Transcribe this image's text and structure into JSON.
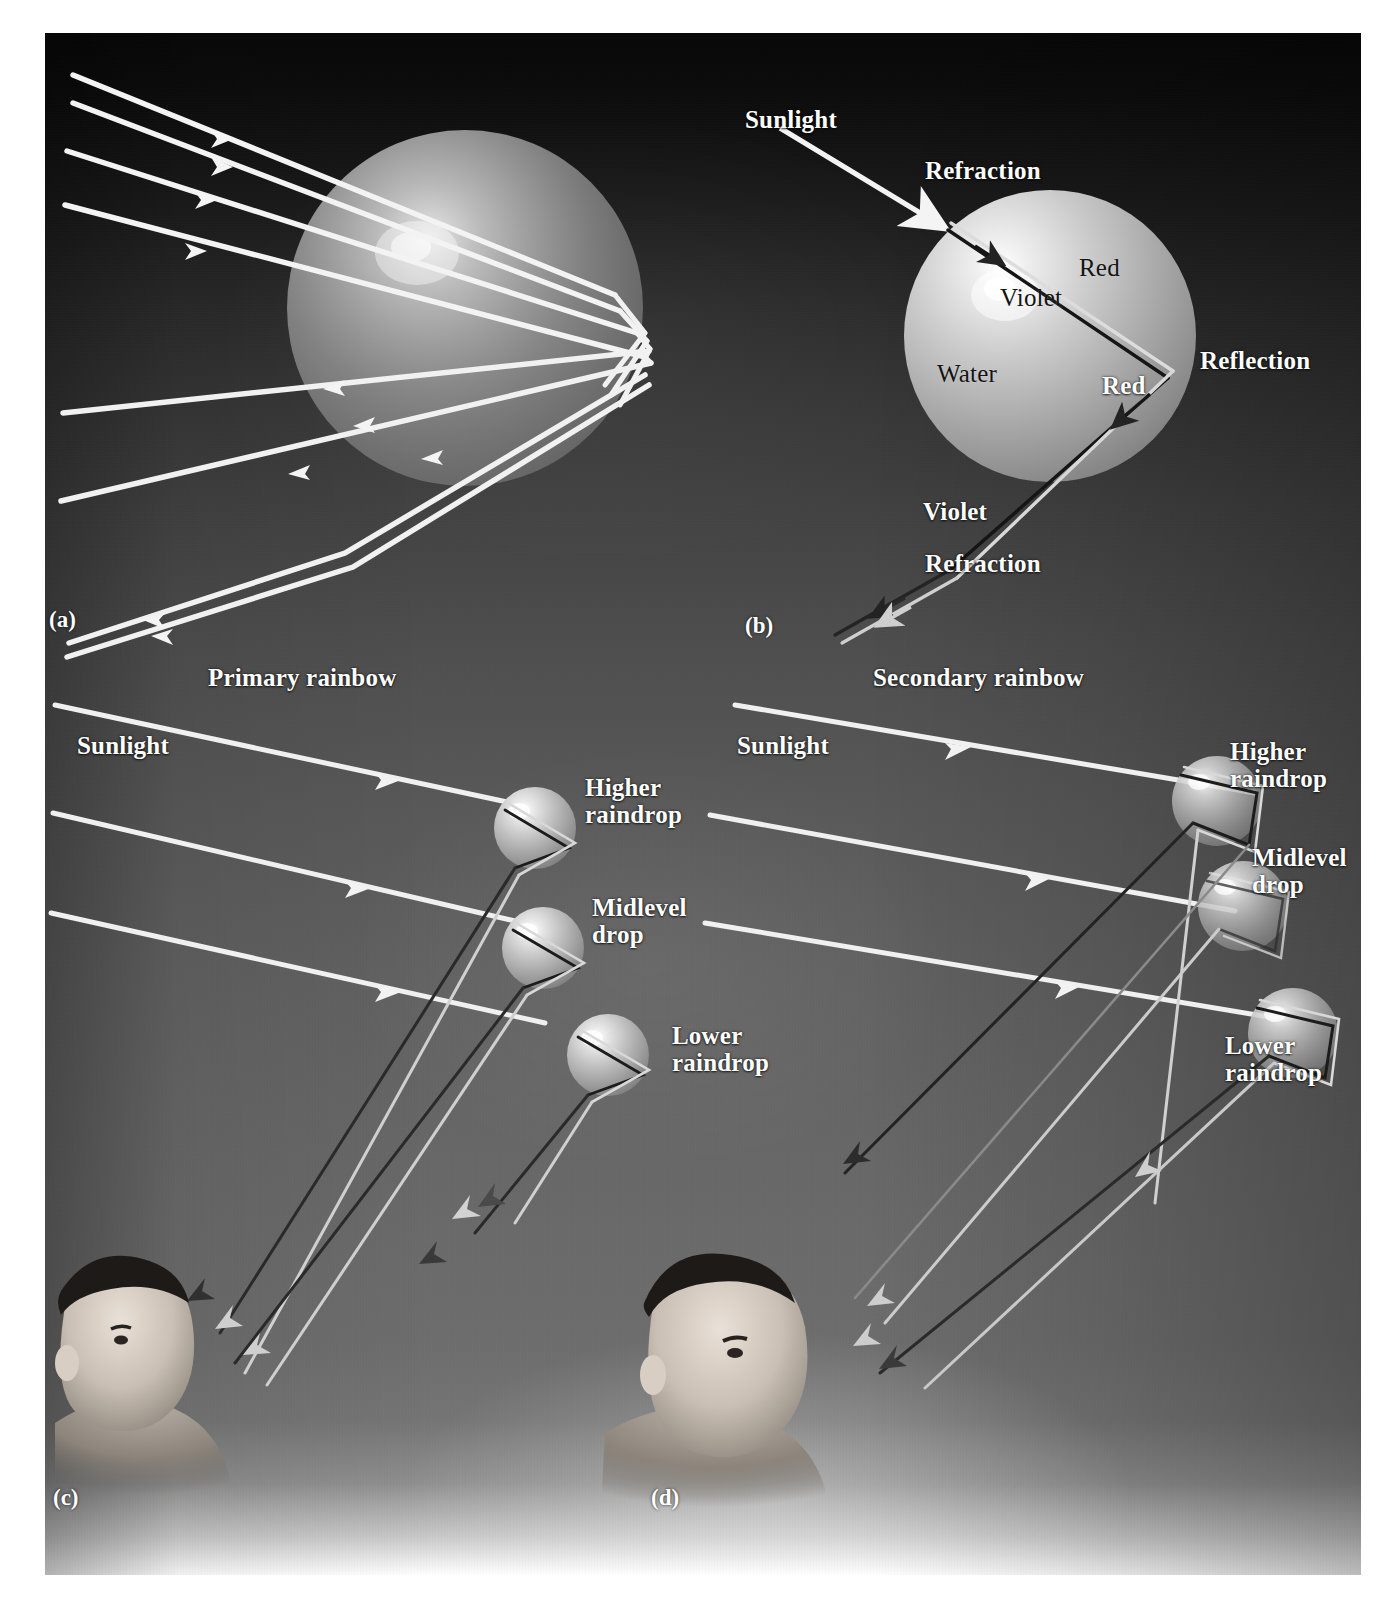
{
  "figure": {
    "kind": "four-panel optics diagram",
    "background": {
      "top_color": "#070707",
      "mid_color": "#5a5a5a",
      "bottom_color": "#ffffff",
      "page_color": "#ffffff"
    },
    "ray_colors": {
      "white_light": "#f2f2f2",
      "red_ray": "#d8d8d8",
      "violet_ray": "#2a2a2a",
      "drop_fill": "#b9b9b9",
      "drop_highlight": "#f5f5f5"
    }
  },
  "panels": [
    {
      "id": "a",
      "id_label": "(a)",
      "caption_labels": []
    },
    {
      "id": "b",
      "id_label": "(b)",
      "caption_labels": [
        {
          "name": "sunlight",
          "text": "Sunlight",
          "style": "white"
        },
        {
          "name": "refraction-1",
          "text": "Refraction",
          "style": "white"
        },
        {
          "name": "red-1",
          "text": "Red",
          "style": "dark"
        },
        {
          "name": "violet-1",
          "text": "Violet",
          "style": "dark"
        },
        {
          "name": "water",
          "text": "Water",
          "style": "dark"
        },
        {
          "name": "reflection",
          "text": "Reflection",
          "style": "white"
        },
        {
          "name": "red-2",
          "text": "Red",
          "style": "white"
        },
        {
          "name": "violet-2",
          "text": "Violet",
          "style": "white"
        },
        {
          "name": "refraction-2",
          "text": "Refraction",
          "style": "white"
        }
      ]
    },
    {
      "id": "c",
      "id_label": "(c)",
      "caption_labels": [
        {
          "name": "primary-rainbow",
          "text": "Primary rainbow",
          "style": "white"
        },
        {
          "name": "sunlight",
          "text": "Sunlight",
          "style": "white"
        },
        {
          "name": "higher-raindrop",
          "text": "Higher\nraindrop",
          "style": "white"
        },
        {
          "name": "midlevel-drop",
          "text": "Midlevel\ndrop",
          "style": "white"
        },
        {
          "name": "lower-raindrop",
          "text": "Lower\nraindrop",
          "style": "white"
        }
      ]
    },
    {
      "id": "d",
      "id_label": "(d)",
      "caption_labels": [
        {
          "name": "secondary-rainbow",
          "text": "Secondary rainbow",
          "style": "white"
        },
        {
          "name": "sunlight",
          "text": "Sunlight",
          "style": "white"
        },
        {
          "name": "higher-raindrop",
          "text": "Higher\nraindrop",
          "style": "white"
        },
        {
          "name": "midlevel-drop",
          "text": "Midlevel\ndrop",
          "style": "white"
        },
        {
          "name": "lower-raindrop",
          "text": "Lower\nraindrop",
          "style": "white"
        }
      ]
    }
  ],
  "labels": {
    "panel_a_id": "(a)",
    "panel_b_id": "(b)",
    "panel_c_id": "(c)",
    "panel_d_id": "(d)",
    "b_sunlight": "Sunlight",
    "b_refraction_top": "Refraction",
    "b_red_in": "Red",
    "b_violet_in": "Violet",
    "b_water": "Water",
    "b_reflection": "Reflection",
    "b_red_out": "Red",
    "b_violet_out": "Violet",
    "b_refraction_bottom": "Refraction",
    "c_primary_rainbow": "Primary rainbow",
    "c_sunlight": "Sunlight",
    "c_higher_raindrop": "Higher\nraindrop",
    "c_midlevel_drop": "Midlevel\ndrop",
    "c_lower_raindrop": "Lower\nraindrop",
    "d_secondary_rainbow": "Secondary rainbow",
    "d_sunlight": "Sunlight",
    "d_higher_raindrop": "Higher\nraindrop",
    "d_midlevel_drop": "Midlevel\ndrop",
    "d_lower_raindrop": "Lower\nraindrop"
  }
}
